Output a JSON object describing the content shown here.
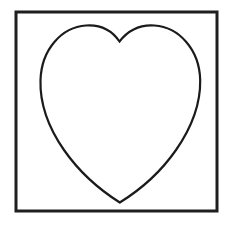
{
  "canvas": {
    "width": 231,
    "height": 227,
    "background_color": "#ffffff",
    "title": "Heart outline inside square frame"
  },
  "frame": {
    "name": "square-border",
    "x": 16,
    "y": 12,
    "width": 201,
    "height": 199,
    "stroke_color": "#1f1f1f",
    "stroke_width": 3,
    "fill": "none"
  },
  "heart": {
    "name": "heart-outline",
    "stroke_color": "#1b1b1b",
    "stroke_width": 2.2,
    "fill": "none",
    "path": "M 119.5 41.5 C 112 30.5 100 24.5 86 25.5 C 62 27 41.5 49 40.5 80 C 39.8 103 48 127 64 150 C 80 173 100 190 119.8 202.5 C 140 190 160 173 176 150 C 192 127 200.6 103 200.2 80 C 199.4 49 178.5 27 154.5 25.5 C 140.5 24.5 128 30.5 119.5 41.5 Z",
    "geometry": {
      "top_cleft": [
        119.5,
        41.5
      ],
      "left_lobe_peak": [
        86,
        26
      ],
      "right_lobe_peak": [
        155,
        26
      ],
      "left_extreme": [
        40,
        87
      ],
      "right_extreme": [
        201,
        87
      ],
      "bottom_tip": [
        120,
        202
      ]
    }
  },
  "labels": {
    "alt_text": "Black line drawing of a heart shape centered inside a thin square border on a white background"
  }
}
